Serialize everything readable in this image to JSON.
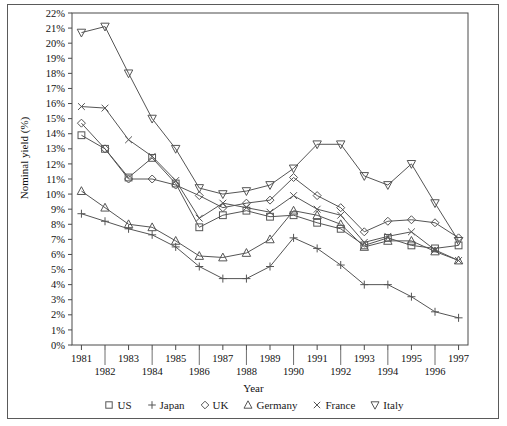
{
  "chart_data": {
    "type": "line",
    "title": "",
    "xlabel": "Year",
    "ylabel": "Nominal yield (%)",
    "x": [
      1981,
      1982,
      1983,
      1984,
      1985,
      1986,
      1987,
      1988,
      1989,
      1990,
      1991,
      1992,
      1993,
      1994,
      1995,
      1996,
      1997
    ],
    "xlim": [
      1980.6,
      1997.4
    ],
    "ylim": [
      0,
      22
    ],
    "ytick_labels": [
      "0%",
      "1%",
      "2%",
      "3%",
      "4%",
      "5%",
      "6%",
      "7%",
      "8%",
      "9%",
      "10%",
      "11%",
      "12%",
      "13%",
      "14%",
      "15%",
      "16%",
      "17%",
      "18%",
      "19%",
      "20%",
      "21%",
      "22%"
    ],
    "xtick_labels": [
      "1981",
      "1982",
      "1983",
      "1984",
      "1985",
      "1986",
      "1987",
      "1988",
      "1989",
      "1990",
      "1991",
      "1992",
      "1993",
      "1994",
      "1995",
      "1996",
      "1997"
    ],
    "grid": false,
    "legend_position": "below",
    "series": [
      {
        "name": "US",
        "marker": "square",
        "values": [
          13.9,
          13.0,
          11.1,
          12.4,
          10.7,
          7.8,
          8.6,
          8.9,
          8.5,
          8.6,
          8.1,
          7.7,
          6.6,
          7.1,
          6.6,
          6.4,
          6.6
        ]
      },
      {
        "name": "Japan",
        "marker": "plus",
        "values": [
          8.7,
          8.2,
          7.7,
          7.3,
          6.5,
          5.2,
          4.4,
          4.4,
          5.2,
          7.1,
          6.4,
          5.3,
          4.0,
          4.0,
          3.2,
          2.2,
          1.8
        ]
      },
      {
        "name": "UK",
        "marker": "diamond",
        "values": [
          14.7,
          13.0,
          11.0,
          11.0,
          10.6,
          9.9,
          9.1,
          9.4,
          9.6,
          11.1,
          9.9,
          9.1,
          7.5,
          8.2,
          8.3,
          8.1,
          7.1
        ]
      },
      {
        "name": "Germany",
        "marker": "triangle-up",
        "values": [
          10.2,
          9.1,
          8.0,
          7.8,
          6.9,
          5.9,
          5.8,
          6.1,
          7.0,
          8.9,
          8.6,
          8.0,
          6.5,
          6.9,
          6.9,
          6.2,
          5.6
        ]
      },
      {
        "name": "France",
        "marker": "cross",
        "values": [
          15.8,
          15.7,
          13.6,
          12.5,
          10.9,
          8.4,
          9.4,
          9.1,
          8.8,
          9.9,
          9.0,
          8.6,
          6.8,
          7.2,
          7.5,
          6.3,
          5.6
        ]
      },
      {
        "name": "Italy",
        "marker": "triangle-down",
        "values": [
          20.7,
          21.1,
          18.0,
          15.0,
          13.0,
          10.4,
          10.0,
          10.2,
          10.6,
          11.7,
          13.3,
          13.3,
          11.2,
          10.6,
          12.0,
          9.4,
          6.9
        ]
      }
    ]
  },
  "legend": {
    "items": [
      {
        "label": "US",
        "marker": "square"
      },
      {
        "label": "Japan",
        "marker": "plus"
      },
      {
        "label": "UK",
        "marker": "diamond"
      },
      {
        "label": "Germany",
        "marker": "triangle-up"
      },
      {
        "label": "France",
        "marker": "cross"
      },
      {
        "label": "Italy",
        "marker": "triangle-down"
      }
    ]
  },
  "colors": {
    "line": "#555555",
    "axis": "#4a4a4a",
    "frame": "#5a5a5a",
    "text": "#111111"
  }
}
